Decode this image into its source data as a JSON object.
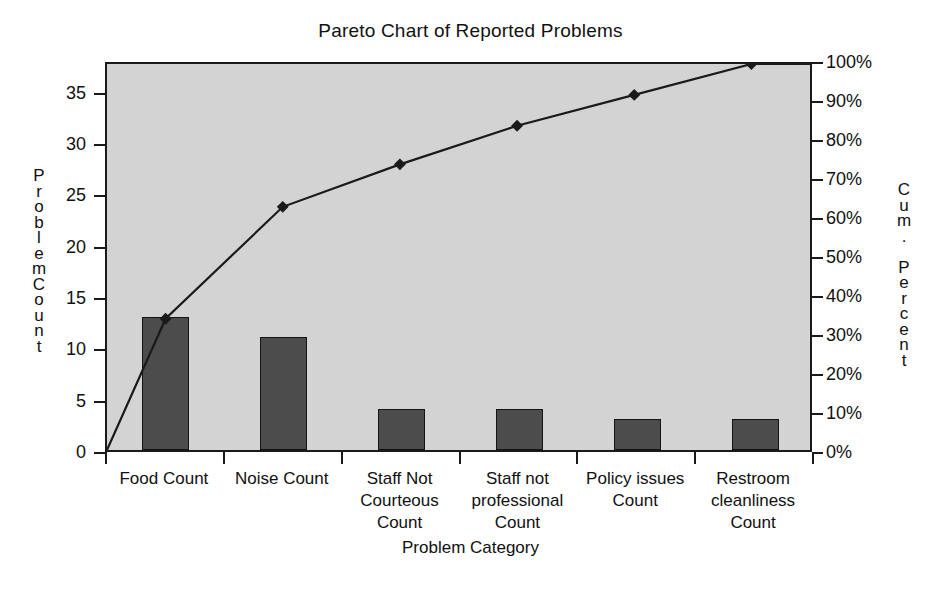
{
  "chart_data": {
    "type": "bar",
    "title": "Pareto Chart of Reported Problems",
    "xlabel": "Problem Category",
    "ylabel": "ProblemCount",
    "y2label": "Cum. Percent",
    "grid": false,
    "legend": "none",
    "categories": [
      "Food Count",
      "Noise Count",
      "Staff Not Courteous Count",
      "Staff not professional Count",
      "Policy issues Count",
      "Restroom cleanliness Count"
    ],
    "category_lines": [
      [
        "Food Count"
      ],
      [
        "Noise Count"
      ],
      [
        "Staff Not",
        "Courteous",
        "Count"
      ],
      [
        "Staff not",
        "professional",
        "Count"
      ],
      [
        "Policy issues",
        "Count"
      ],
      [
        "Restroom",
        "cleanliness",
        "Count"
      ]
    ],
    "values": [
      13,
      11,
      4,
      4,
      3,
      3
    ],
    "cumulative_percent": [
      34,
      63,
      74,
      84,
      92,
      100
    ],
    "total_count": 38,
    "ylim": [
      0,
      38
    ],
    "y2lim": [
      0,
      100
    ],
    "yticks": [
      "0",
      "5",
      "10",
      "15",
      "20",
      "25",
      "30",
      "35"
    ],
    "ytick_values": [
      0,
      5,
      10,
      15,
      20,
      25,
      30,
      35
    ],
    "y2ticks": [
      "0%",
      "10%",
      "20%",
      "30%",
      "40%",
      "50%",
      "60%",
      "70%",
      "80%",
      "90%",
      "100%"
    ],
    "y2tick_values": [
      0,
      10,
      20,
      30,
      40,
      50,
      60,
      70,
      80,
      90,
      100
    ],
    "series": [
      {
        "name": "ProblemCount",
        "type": "bar",
        "values": [
          13,
          11,
          4,
          4,
          3,
          3
        ]
      },
      {
        "name": "Cum. Percent",
        "type": "line",
        "values": [
          34,
          63,
          74,
          84,
          92,
          100
        ]
      }
    ]
  },
  "style": {
    "plot_background": "#d3d3d3",
    "bar_fill": "#4c4c4c",
    "bar_border": "#141414",
    "line_color": "#1a1a1a",
    "axis_color": "#1a1a1a",
    "text_color": "#111111",
    "page_background": "#ffffff"
  }
}
